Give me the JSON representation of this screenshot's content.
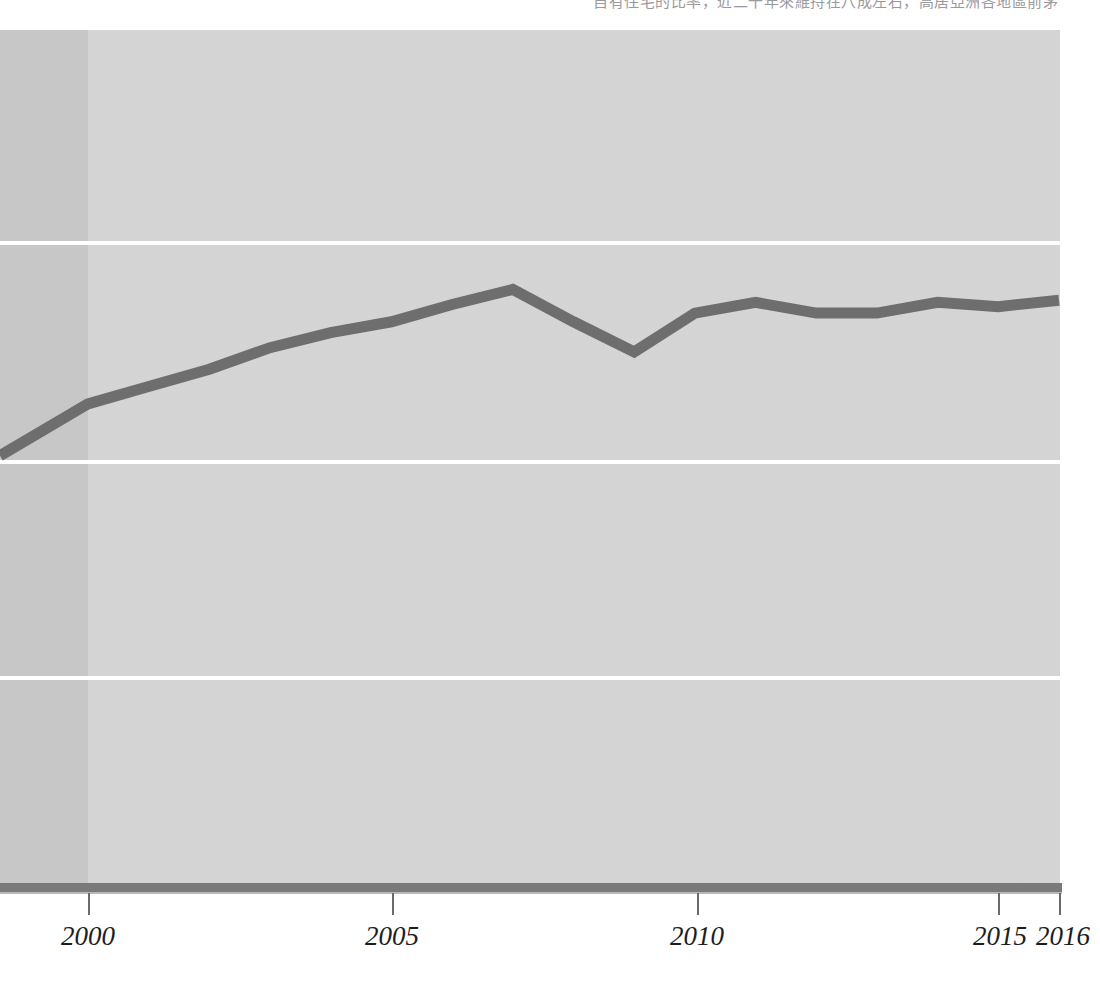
{
  "caption": {
    "text": "自有住宅的比率，近二十年來維持在八成左右，高居亞洲各地區前茅"
  },
  "chart_data": {
    "type": "line",
    "title": "",
    "subtitle": "",
    "xlabel": "",
    "ylabel": "",
    "legend": [],
    "legend_position": "none",
    "grid": true,
    "gridlines_y": [
      1,
      2,
      3
    ],
    "xlim": [
      1998.55,
      2016
    ],
    "ylim": [
      0.05,
      3.95
    ],
    "x_tick_labels": [
      "2000",
      "2005",
      "2010",
      "2015",
      "2016"
    ],
    "x_ticks": [
      2000,
      2005,
      2010,
      2015,
      2016
    ],
    "y_tick_labels": [],
    "series": [
      {
        "name": "series-1",
        "color": "#6e6e6e",
        "x": [
          1998.55,
          2000,
          2001,
          2002,
          2003,
          2004,
          2005,
          2006,
          2007,
          2008,
          2009,
          2010,
          2011,
          2012,
          2013,
          2014,
          2015,
          2016
        ],
        "values": [
          2.02,
          2.26,
          2.34,
          2.42,
          2.52,
          2.59,
          2.64,
          2.72,
          2.79,
          2.64,
          2.5,
          2.68,
          2.73,
          2.68,
          2.68,
          2.73,
          2.71,
          2.74
        ]
      }
    ],
    "shaded_regions": [
      {
        "name": "pre-2000-band",
        "x_start": 1998.55,
        "x_end": 2000,
        "color": "#c9c9c9"
      },
      {
        "name": "main-band",
        "x_start": 2000,
        "x_end": 2016,
        "color": "#d7d7d7"
      }
    ],
    "colors": {
      "line": "#6e6e6e",
      "gridline": "#ffffff",
      "axis": "#7a7a7a",
      "plot_background_main": "#d7d7d7",
      "plot_background_pre": "#c9c9c9",
      "tick_label": "#1d1d1d"
    }
  }
}
